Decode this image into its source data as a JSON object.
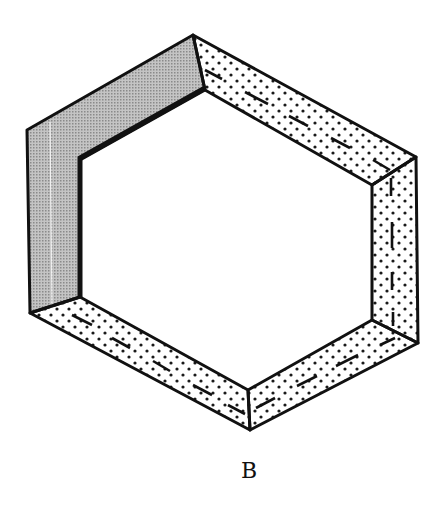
{
  "figure": {
    "label": "B",
    "colors": {
      "line": "#111111",
      "shaded_wall": "#b8b8b8",
      "stipple_dot": "#1a1a1a",
      "background": "#ffffff"
    },
    "faces": [
      {
        "name": "left-upper-wall",
        "fill": "gray-shaded"
      },
      {
        "name": "top-right-wall",
        "fill": "stippled",
        "dashed_centerline": true
      },
      {
        "name": "right-wall",
        "fill": "stippled",
        "dashed_centerline": true
      },
      {
        "name": "bottom-right-wall",
        "fill": "stippled",
        "dashed_centerline": true
      },
      {
        "name": "bottom-left-wall",
        "fill": "stippled",
        "dashed_centerline": true
      }
    ]
  }
}
